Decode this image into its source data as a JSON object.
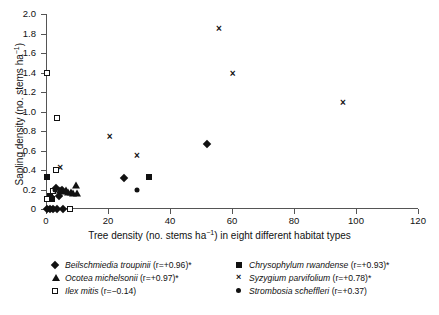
{
  "chart_data": {
    "type": "scatter",
    "title": "",
    "xlabel_plain": "Tree density (no. stems  ha-1) in eight different habitat types",
    "xlabel_pre": "Tree density (no. stems  ha",
    "xlabel_sup": "−1",
    "xlabel_post": ") in eight different habitat types",
    "ylabel_pre": "Sapling density (no. stems  ha",
    "ylabel_sup": "−1",
    "ylabel_post": ")",
    "xlim": [
      0,
      120
    ],
    "ylim": [
      0,
      2.0
    ],
    "xticks": [
      0,
      20,
      40,
      60,
      80,
      100,
      120
    ],
    "xtick_labels": [
      "0",
      "20",
      "40",
      "60",
      "80",
      "100",
      "120"
    ],
    "yticks": [
      0,
      0.2,
      0.4,
      0.6,
      0.8,
      1.0,
      1.2,
      1.4,
      1.6,
      1.8,
      2.0
    ],
    "ytick_labels": [
      "0",
      "0.2",
      "0.4",
      "0.6",
      "0.8",
      "1.0",
      "1.2",
      "1.4",
      "1.6",
      "1.8",
      "2.0"
    ],
    "grid": false,
    "legend_position": "below-plot",
    "series": [
      {
        "name": "Beilschmiedia troupinii",
        "marker": "diamond",
        "r": "+0.96",
        "significant": true,
        "points": [
          [
            0.4,
            0.0
          ],
          [
            1.2,
            0.0
          ],
          [
            2.2,
            0.0
          ],
          [
            3.4,
            0.0
          ],
          [
            5.6,
            0.0
          ],
          [
            1.6,
            0.12
          ],
          [
            3.2,
            0.22
          ],
          [
            4.2,
            0.13
          ],
          [
            5.0,
            0.19
          ],
          [
            25.3,
            0.32
          ],
          [
            51.8,
            0.67
          ]
        ]
      },
      {
        "name": "Chrysophylum rwandense",
        "marker": "square",
        "r": "+0.93",
        "significant": true,
        "points": [
          [
            0.3,
            0.33
          ],
          [
            1.4,
            0.13
          ],
          [
            1.8,
            0.1
          ],
          [
            33.2,
            0.33
          ]
        ]
      },
      {
        "name": "Ocotea michelsonii",
        "marker": "triangle",
        "r": "+0.97",
        "significant": true,
        "points": [
          [
            4.6,
            0.2
          ],
          [
            5.6,
            0.18
          ],
          [
            6.4,
            0.19
          ],
          [
            7.2,
            0.17
          ],
          [
            8.0,
            0.17
          ],
          [
            8.8,
            0.16
          ],
          [
            9.6,
            0.25
          ],
          [
            9.9,
            0.16
          ]
        ]
      },
      {
        "name": "Syzygium parvifolium",
        "marker": "cross",
        "r": "+0.78",
        "significant": true,
        "points": [
          [
            0.2,
            0.33
          ],
          [
            4.6,
            0.43
          ],
          [
            20.5,
            0.75
          ],
          [
            29.3,
            0.55
          ],
          [
            55.8,
            1.86
          ],
          [
            60.2,
            1.39
          ],
          [
            95.8,
            1.1
          ]
        ]
      },
      {
        "name": "Ilex mitis",
        "marker": "open-square",
        "r": "−0.14",
        "significant": false,
        "points": [
          [
            0.2,
            1.39
          ],
          [
            3.6,
            0.93
          ],
          [
            3.2,
            0.4
          ],
          [
            2.4,
            0.18
          ],
          [
            0.4,
            0.1
          ],
          [
            7.8,
            0.0
          ]
        ]
      },
      {
        "name": "Strombosia scheffleri",
        "marker": "circle",
        "r": "+0.37",
        "significant": false,
        "points": [
          [
            0.6,
            0.0
          ],
          [
            1.6,
            0.0
          ],
          [
            2.6,
            0.0
          ],
          [
            2.0,
            0.11
          ],
          [
            3.0,
            0.2
          ],
          [
            29.2,
            0.2
          ]
        ]
      }
    ]
  },
  "legend": {
    "items": [
      {
        "marker": "diamond",
        "name": "Beilschmiedia troupinii",
        "stat": "(r=+0.96)*"
      },
      {
        "marker": "square",
        "name": "Chrysophylum rwandense",
        "stat": "(r=+0.93)*"
      },
      {
        "marker": "triangle",
        "name": "Ocotea michelsonii",
        "stat": "(r=+0.97)*"
      },
      {
        "marker": "cross",
        "name": "Syzygium parvifolium",
        "stat": "(r=+0.78)*"
      },
      {
        "marker": "open-square",
        "name": "Ilex mitis",
        "stat": "(r=−0.14)"
      },
      {
        "marker": "circle",
        "name": "Strombosia scheffleri",
        "stat": "(r=+0.37)"
      }
    ]
  },
  "colors": {
    "marker": "#111111",
    "axis": "#555555",
    "background": "#ffffff",
    "text": "#111111"
  }
}
